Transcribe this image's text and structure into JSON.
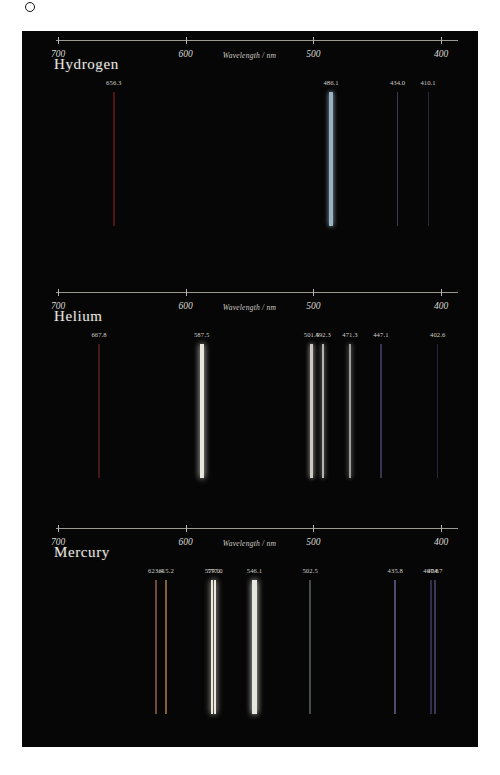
{
  "figure": {
    "background_color": "#060606",
    "axis": {
      "title": "Wavelength / nm",
      "ticks": [
        {
          "label": "700",
          "value": 700
        },
        {
          "label": "600",
          "value": 600
        },
        {
          "label": "500",
          "value": 500
        },
        {
          "label": "400",
          "value": 400
        }
      ],
      "range_nm": [
        710,
        393
      ]
    }
  },
  "chart_data": {
    "type": "line",
    "xlabel": "Wavelength / nm",
    "ylabel": "",
    "xlim": [
      710,
      393
    ],
    "grid": false,
    "legend": "none",
    "panels": [
      {
        "name": "Hydrogen",
        "lines": [
          {
            "label": "656.3",
            "wavelength": 656.3,
            "color": "#7d1f18",
            "width": 2.2,
            "intensity": 0.42
          },
          {
            "label": "486.1",
            "wavelength": 486.1,
            "color": "#9fb9c9",
            "width": 3.4,
            "intensity": 0.95
          },
          {
            "label": "434.0",
            "wavelength": 434.0,
            "color": "#5a5f8e",
            "width": 1.2,
            "intensity": 0.4
          },
          {
            "label": "410.1",
            "wavelength": 410.1,
            "color": "#4a4270",
            "width": 1.2,
            "intensity": 0.32
          }
        ]
      },
      {
        "name": "Helium",
        "lines": [
          {
            "label": "667.8",
            "wavelength": 667.8,
            "color": "#6d2a22",
            "width": 1.4,
            "intensity": 0.38
          },
          {
            "label": "587.5",
            "wavelength": 587.5,
            "color": "#e9e6dd",
            "width": 4.0,
            "intensity": 1.0
          },
          {
            "label": "501.5",
            "wavelength": 501.5,
            "color": "#d6d4cd",
            "width": 3.6,
            "intensity": 0.92
          },
          {
            "label": "492.3",
            "wavelength": 492.3,
            "color": "#c9c7c1",
            "width": 2.4,
            "intensity": 0.85
          },
          {
            "label": "471.3",
            "wavelength": 471.3,
            "color": "#b8b6b2",
            "width": 2.4,
            "intensity": 0.78
          },
          {
            "label": "447.1",
            "wavelength": 447.1,
            "color": "#55527e",
            "width": 1.3,
            "intensity": 0.42
          },
          {
            "label": "402.6",
            "wavelength": 402.6,
            "color": "#474066",
            "width": 1.2,
            "intensity": 0.3
          }
        ]
      },
      {
        "name": "Mercury",
        "lines": [
          {
            "label": "623.4",
            "wavelength": 623.4,
            "color": "#9a6a4a",
            "width": 1.8,
            "intensity": 0.55
          },
          {
            "label": "615.2",
            "wavelength": 615.2,
            "color": "#b08050",
            "width": 2.0,
            "intensity": 0.6
          },
          {
            "label": "579.0",
            "wavelength": 579.0,
            "color": "#ece9dc",
            "width": 2.0,
            "intensity": 1.0
          },
          {
            "label": "577.0",
            "wavelength": 577.0,
            "color": "#ece9dc",
            "width": 2.0,
            "intensity": 1.0
          },
          {
            "label": "546.1",
            "wavelength": 546.1,
            "color": "#e4e8de",
            "width": 4.2,
            "intensity": 1.0
          },
          {
            "label": "502.5",
            "wavelength": 502.5,
            "color": "#6f7a72",
            "width": 1.3,
            "intensity": 0.4
          },
          {
            "label": "435.8",
            "wavelength": 435.8,
            "color": "#6d6a9a",
            "width": 1.8,
            "intensity": 0.55
          },
          {
            "label": "407.8",
            "wavelength": 407.8,
            "color": "#4e4878",
            "width": 1.3,
            "intensity": 0.38
          },
          {
            "label": "404.7",
            "wavelength": 404.7,
            "color": "#5a5286",
            "width": 1.6,
            "intensity": 0.45
          }
        ]
      }
    ]
  }
}
